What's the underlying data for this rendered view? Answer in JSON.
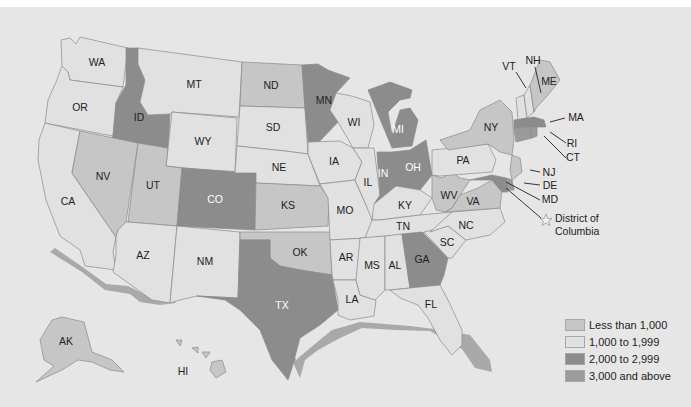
{
  "map": {
    "type": "choropleth",
    "region": "United States",
    "classes": [
      {
        "id": "lt1000",
        "label": "Less than 1,000",
        "color": "#c6c6c6"
      },
      {
        "id": "1000-1999",
        "label": "1,000 to 1,999",
        "color": "#e1e1e1"
      },
      {
        "id": "2000-2999",
        "label": "2,000 to 2,999",
        "color": "#8c8c8c"
      },
      {
        "id": "gte3000",
        "label": "3,000 and above",
        "color": "#9b9b9b"
      }
    ],
    "states": [
      {
        "abbr": "WA",
        "class": "1000-1999"
      },
      {
        "abbr": "OR",
        "class": "1000-1999"
      },
      {
        "abbr": "CA",
        "class": "1000-1999"
      },
      {
        "abbr": "ID",
        "class": "2000-2999"
      },
      {
        "abbr": "NV",
        "class": "lt1000"
      },
      {
        "abbr": "MT",
        "class": "1000-1999"
      },
      {
        "abbr": "WY",
        "class": "1000-1999"
      },
      {
        "abbr": "UT",
        "class": "lt1000"
      },
      {
        "abbr": "AZ",
        "class": "1000-1999"
      },
      {
        "abbr": "CO",
        "class": "2000-2999"
      },
      {
        "abbr": "NM",
        "class": "1000-1999"
      },
      {
        "abbr": "ND",
        "class": "lt1000"
      },
      {
        "abbr": "SD",
        "class": "1000-1999"
      },
      {
        "abbr": "NE",
        "class": "1000-1999"
      },
      {
        "abbr": "KS",
        "class": "lt1000"
      },
      {
        "abbr": "OK",
        "class": "lt1000"
      },
      {
        "abbr": "TX",
        "class": "2000-2999"
      },
      {
        "abbr": "MN",
        "class": "2000-2999"
      },
      {
        "abbr": "IA",
        "class": "1000-1999"
      },
      {
        "abbr": "MO",
        "class": "1000-1999"
      },
      {
        "abbr": "AR",
        "class": "1000-1999"
      },
      {
        "abbr": "LA",
        "class": "1000-1999"
      },
      {
        "abbr": "WI",
        "class": "1000-1999"
      },
      {
        "abbr": "IL",
        "class": "1000-1999"
      },
      {
        "abbr": "MI",
        "class": "2000-2999"
      },
      {
        "abbr": "IN",
        "class": "2000-2999"
      },
      {
        "abbr": "OH",
        "class": "2000-2999"
      },
      {
        "abbr": "KY",
        "class": "1000-1999"
      },
      {
        "abbr": "TN",
        "class": "1000-1999"
      },
      {
        "abbr": "MS",
        "class": "1000-1999"
      },
      {
        "abbr": "AL",
        "class": "1000-1999"
      },
      {
        "abbr": "GA",
        "class": "2000-2999"
      },
      {
        "abbr": "FL",
        "class": "1000-1999"
      },
      {
        "abbr": "SC",
        "class": "1000-1999"
      },
      {
        "abbr": "NC",
        "class": "1000-1999"
      },
      {
        "abbr": "VA",
        "class": "lt1000"
      },
      {
        "abbr": "WV",
        "class": "lt1000"
      },
      {
        "abbr": "PA",
        "class": "1000-1999"
      },
      {
        "abbr": "NY",
        "class": "lt1000"
      },
      {
        "abbr": "VT",
        "class": "1000-1999"
      },
      {
        "abbr": "NH",
        "class": "1000-1999"
      },
      {
        "abbr": "ME",
        "class": "lt1000"
      },
      {
        "abbr": "MA",
        "class": "2000-2999"
      },
      {
        "abbr": "RI",
        "class": "gte3000"
      },
      {
        "abbr": "CT",
        "class": "gte3000"
      },
      {
        "abbr": "NJ",
        "class": "lt1000"
      },
      {
        "abbr": "DE",
        "class": "gte3000"
      },
      {
        "abbr": "MD",
        "class": "2000-2999"
      },
      {
        "abbr": "AK",
        "class": "lt1000"
      },
      {
        "abbr": "HI",
        "class": "lt1000"
      }
    ],
    "district": {
      "label_line1": "District of",
      "label_line2": "Columbia",
      "marker": "star-icon"
    }
  }
}
